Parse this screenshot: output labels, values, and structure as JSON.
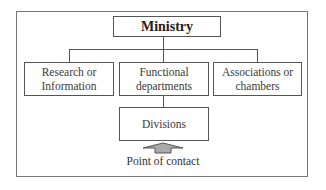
{
  "diagram": {
    "root": {
      "label": "Ministry"
    },
    "level1": [
      {
        "label": "Research or Information"
      },
      {
        "label": "Functional departments"
      },
      {
        "label": "Associations or chambers"
      }
    ],
    "level2": {
      "label": "Divisions",
      "parent": "Functional departments"
    },
    "arrow": {
      "direction": "up",
      "target": "Divisions",
      "fill": "#aaaaaa"
    },
    "caption": "Point of contact"
  },
  "labels": {
    "ministry": "Ministry",
    "research_line1": "Research or",
    "research_line2": "Information",
    "functional_line1": "Functional",
    "functional_line2": "departments",
    "associations_line1": "Associations or",
    "associations_line2": "chambers",
    "divisions": "Divisions",
    "point_of_contact": "Point of contact"
  }
}
